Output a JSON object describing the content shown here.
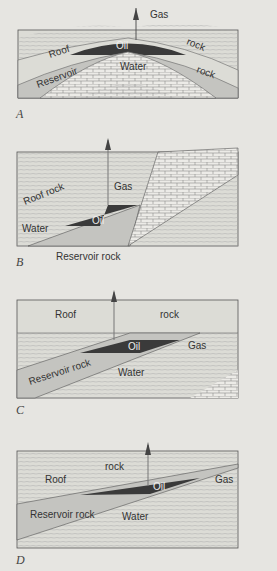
{
  "figure": {
    "panels": [
      {
        "letter": "A",
        "type": "anticline",
        "labels": {
          "gas": "Gas",
          "oil": "Oil",
          "water": "Water",
          "roof1": "Roof",
          "roof2": "rock",
          "res1": "Reservoir",
          "res2": "rock"
        }
      },
      {
        "letter": "B",
        "type": "fault trap",
        "labels": {
          "roof": "Roof  rock",
          "gas": "Gas",
          "oil": "Oil",
          "water": "Water",
          "reservoir": "Reservoir rock"
        }
      },
      {
        "letter": "C",
        "type": "unconformity trap",
        "labels": {
          "roof1": "Roof",
          "roof2": "rock",
          "oil": "Oil",
          "gas": "Gas",
          "reservoir": "Reservoir rock",
          "water": "Water"
        }
      },
      {
        "letter": "D",
        "type": "pinch-out trap",
        "labels": {
          "roof1": "Roof",
          "roof2": "rock",
          "oil": "Oil",
          "gas": "Gas",
          "reservoir": "Reservoir rock",
          "water": "Water"
        }
      }
    ],
    "colors": {
      "oil": "#3a3a3a",
      "reservoir": "#c4c4c0",
      "roof": "#dcdcd6",
      "water": "#c8c8c4",
      "line": "#555555"
    }
  }
}
